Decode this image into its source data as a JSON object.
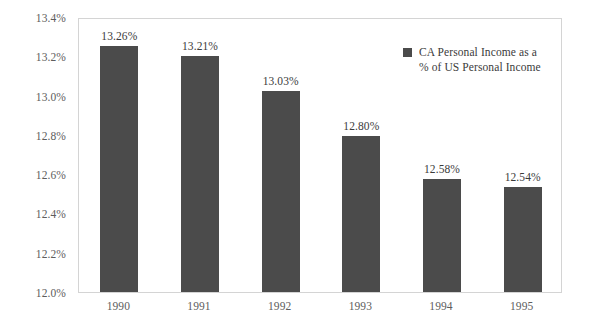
{
  "chart_data": {
    "type": "bar",
    "title": "",
    "xlabel": "",
    "ylabel": "",
    "categories": [
      "1990",
      "1991",
      "1992",
      "1993",
      "1994",
      "1995"
    ],
    "values": [
      13.26,
      13.21,
      13.03,
      12.8,
      12.58,
      12.54
    ],
    "data_labels": [
      "13.26%",
      "13.21%",
      "13.03%",
      "12.80%",
      "12.58%",
      "12.54%"
    ],
    "ylim": [
      12.0,
      13.4
    ],
    "ytick_values": [
      12.0,
      12.2,
      12.4,
      12.6,
      12.8,
      13.0,
      13.2,
      13.4
    ],
    "ytick_labels": [
      "12.0%",
      "12.2%",
      "12.4%",
      "12.6%",
      "12.8%",
      "13.0%",
      "13.2%",
      "13.4%"
    ],
    "grid": false,
    "legend_position": "inside-top-right",
    "series": [
      {
        "name": "CA Personal Income as a % of US Personal Income",
        "color": "#4b4b4b",
        "values": [
          13.26,
          13.21,
          13.03,
          12.8,
          12.58,
          12.54
        ]
      }
    ]
  },
  "legend": {
    "swatch_color": "#4b4b4b",
    "line1": "CA Personal Income as a",
    "line2": "% of US Personal Income"
  },
  "colors": {
    "bar": "#4b4b4b",
    "plot_border": "#d4d4d4",
    "axis_text": "#5d5d5d",
    "label_text": "#3b3b3b",
    "background": "#ffffff"
  }
}
